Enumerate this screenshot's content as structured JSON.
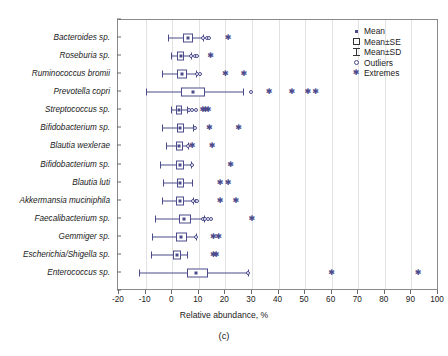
{
  "chart_data": {
    "type": "box",
    "title": "",
    "panel_caption": "(c)",
    "xlabel": "Relative abundance, %",
    "ylabel": "",
    "xlim": [
      -20,
      100
    ],
    "xticks": [
      -20,
      -10,
      0,
      10,
      20,
      30,
      40,
      50,
      60,
      70,
      80,
      90,
      100
    ],
    "xtick_labels": [
      "-20",
      "-10",
      "0",
      "10",
      "20",
      "30",
      "40",
      "50",
      "60",
      "70",
      "80",
      "90",
      "100"
    ],
    "grid": "vertical",
    "orientation": "horizontal",
    "legend_position": "top-right",
    "marker_color": "#4b4b8c",
    "legend": [
      {
        "key": "mean",
        "label": "Mean"
      },
      {
        "key": "se",
        "label": "Mean±SE"
      },
      {
        "key": "sd",
        "label": "Mean±SD"
      },
      {
        "key": "outliers",
        "label": "Outliers"
      },
      {
        "key": "extremes",
        "label": "Extremes"
      }
    ],
    "categories": [
      "Bacteroides sp.",
      "Roseburia sp.",
      "Ruminococcus bromii",
      "Prevotella copri",
      "Streptococcus sp.",
      "Bifidobacterium sp.",
      "Blautia wexlerae",
      "Bifidobacterium sp.",
      "Blautia luti",
      "Akkermansia muciniphila",
      "Faecalibacterium sp.",
      "Gemmiger sp.",
      "Escherichia/Shigella sp.",
      "Enterococcus sp."
    ],
    "series": [
      {
        "name": "Bacteroides sp.",
        "sd_low": -1.5,
        "sd_high": 11.5,
        "se_low": 4.2,
        "se_high": 7.8,
        "mean": 6.0,
        "outliers": [
          11.5,
          13.0,
          14.0
        ],
        "extremes": [
          21.0
        ]
      },
      {
        "name": "Roseburia sp.",
        "sd_low": -0.5,
        "sd_high": 7.0,
        "se_low": 2.0,
        "se_high": 4.5,
        "mean": 3.2,
        "outliers": [
          7.0,
          8.5,
          9.5
        ],
        "extremes": [
          14.5
        ]
      },
      {
        "name": "Ruminococcus bromii",
        "sd_low": -4.0,
        "sd_high": 9.0,
        "se_low": 2.0,
        "se_high": 5.5,
        "mean": 3.6,
        "outliers": [
          9.5,
          10.5
        ],
        "extremes": [
          20.0,
          27.0
        ]
      },
      {
        "name": "Prevotella copri",
        "sd_low": -10.0,
        "sd_high": 26.5,
        "se_low": 3.5,
        "se_high": 12.5,
        "mean": 8.0,
        "outliers": [
          29.5
        ],
        "extremes": [
          36.5,
          45.0,
          51.0,
          54.0
        ]
      },
      {
        "name": "Streptococcus sp.",
        "sd_low": -0.5,
        "sd_high": 5.5,
        "se_low": 1.5,
        "se_high": 3.8,
        "mean": 2.6,
        "outliers": [
          6.5,
          7.5,
          9.0
        ],
        "extremes": [
          11.5,
          12.5,
          13.5
        ]
      },
      {
        "name": "Bifidobacterium sp.",
        "sd_low": -4.0,
        "sd_high": 8.0,
        "se_low": 1.8,
        "se_high": 4.5,
        "mean": 3.0,
        "outliers": [
          8.5
        ],
        "extremes": [
          14.0,
          25.0
        ]
      },
      {
        "name": "Blautia wexlerae",
        "sd_low": -2.5,
        "sd_high": 6.0,
        "se_low": 1.5,
        "se_high": 4.0,
        "mean": 2.7,
        "outliers": [
          6.0
        ],
        "extremes": [
          7.5,
          15.0
        ]
      },
      {
        "name": "Bifidobacterium sp.",
        "sd_low": -4.5,
        "sd_high": 7.0,
        "se_low": 1.5,
        "se_high": 4.5,
        "mean": 2.9,
        "outliers": [
          7.5
        ],
        "extremes": [
          22.0
        ]
      },
      {
        "name": "Blautia luti",
        "sd_low": -3.5,
        "sd_high": 7.5,
        "se_low": 1.8,
        "se_high": 4.5,
        "mean": 3.0,
        "outliers": [],
        "extremes": [
          18.0,
          21.0
        ]
      },
      {
        "name": "Akkermansia muciniphila",
        "sd_low": -4.0,
        "sd_high": 8.0,
        "se_low": 1.5,
        "se_high": 4.5,
        "mean": 2.8,
        "outliers": [
          8.0,
          8.8,
          9.5
        ],
        "extremes": [
          18.0,
          24.0
        ]
      },
      {
        "name": "Faecalibacterium sp.",
        "sd_low": -6.5,
        "sd_high": 12.0,
        "se_low": 2.5,
        "se_high": 7.0,
        "mean": 4.6,
        "outliers": [
          11.5,
          12.5,
          13.5,
          14.5
        ],
        "extremes": [
          30.0
        ]
      },
      {
        "name": "Gemmiger sp.",
        "sd_low": -7.5,
        "sd_high": 9.0,
        "se_low": 1.5,
        "se_high": 5.5,
        "mean": 3.4,
        "outliers": [
          9.0
        ],
        "extremes": [
          15.5,
          17.5
        ]
      },
      {
        "name": "Escherichia/Shigella sp.",
        "sd_low": -8.0,
        "sd_high": 5.5,
        "se_low": 0.5,
        "se_high": 3.5,
        "mean": 1.8,
        "outliers": [],
        "extremes": [
          15.5,
          16.5
        ]
      },
      {
        "name": "Enterococcus sp.",
        "sd_low": -12.5,
        "sd_high": 28.5,
        "se_low": 5.5,
        "se_high": 13.5,
        "mean": 9.0,
        "outliers": [
          28.5
        ],
        "extremes": [
          60.0,
          92.5
        ]
      }
    ]
  }
}
